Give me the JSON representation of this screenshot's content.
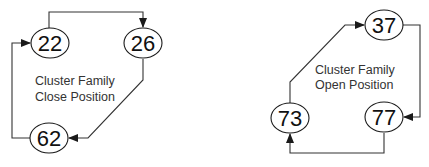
{
  "diagrams": [
    {
      "caption_line1": "Cluster Family",
      "caption_line2": "Close Position",
      "nodes": [
        {
          "label": "22"
        },
        {
          "label": "26"
        },
        {
          "label": "62"
        }
      ],
      "edges": [
        {
          "from": "22",
          "to": "26"
        },
        {
          "from": "26",
          "to": "62"
        },
        {
          "from": "62",
          "to": "22"
        }
      ]
    },
    {
      "caption_line1": "Cluster Family",
      "caption_line2": "Open Position",
      "nodes": [
        {
          "label": "37"
        },
        {
          "label": "77"
        },
        {
          "label": "73"
        }
      ],
      "edges": [
        {
          "from": "37",
          "to": "77"
        },
        {
          "from": "77",
          "to": "73"
        },
        {
          "from": "73",
          "to": "37"
        }
      ]
    }
  ],
  "colors": {
    "line": "#333333",
    "text": "#111111",
    "background": "#ffffff"
  }
}
